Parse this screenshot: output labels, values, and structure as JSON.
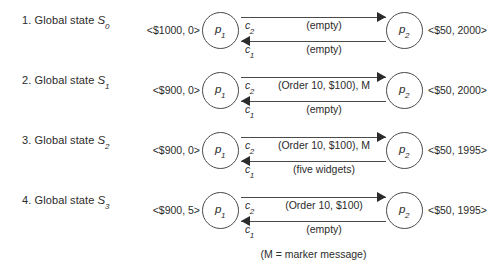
{
  "figure": {
    "footnote": "(M = marker message)",
    "process_left_name": "p",
    "process_left_sub": "1",
    "process_right_name": "p",
    "process_right_sub": "2",
    "channel_top_name": "c",
    "channel_top_sub": "2",
    "channel_bottom_name": "c",
    "channel_bottom_sub": "1",
    "line_color": "#4a4a4a",
    "text_color": "#2b2b2b"
  },
  "rows": [
    {
      "number": "1.",
      "caption_text": "Global state",
      "state_symbol": "S",
      "state_subscript": "0",
      "left_state": "<$1000, 0>",
      "right_state": "<$50, 2000>",
      "channel_top_content": "(empty)",
      "channel_bottom_content": "(empty)"
    },
    {
      "number": "2.",
      "caption_text": "Global state",
      "state_symbol": "S",
      "state_subscript": "1",
      "left_state": "<$900, 0>",
      "right_state": "<$50, 2000>",
      "channel_top_content": "(Order 10, $100), M",
      "channel_bottom_content": "(empty)"
    },
    {
      "number": "3.",
      "caption_text": "Global state",
      "state_symbol": "S",
      "state_subscript": "2",
      "left_state": "<$900, 0>",
      "right_state": "<$50, 1995>",
      "channel_top_content": "(Order 10, $100), M",
      "channel_bottom_content": "(five widgets)"
    },
    {
      "number": "4.",
      "caption_text": "Global state",
      "state_symbol": "S",
      "state_subscript": "3",
      "left_state": "<$900, 5>",
      "right_state": "<$50, 1995>",
      "channel_top_content": "(Order 10, $100)",
      "channel_bottom_content": "(empty)"
    }
  ]
}
